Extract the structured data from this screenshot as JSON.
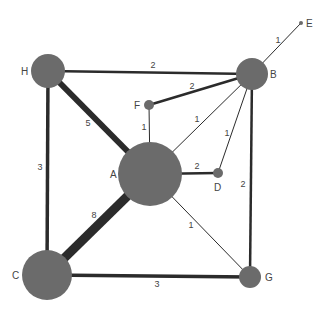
{
  "graph": {
    "colors": {
      "node": "#6b6b6b",
      "edge": "#2b2b2b",
      "text": "#444444",
      "background": "#ffffff"
    },
    "nodes": [
      {
        "id": "A",
        "label": "A",
        "x": 150,
        "y": 174,
        "r": 32,
        "label_x": 110,
        "label_y": 178
      },
      {
        "id": "B",
        "label": "B",
        "x": 252,
        "y": 74,
        "r": 16,
        "label_x": 270,
        "label_y": 78
      },
      {
        "id": "C",
        "label": "C",
        "x": 47,
        "y": 275,
        "r": 25,
        "label_x": 12,
        "label_y": 279
      },
      {
        "id": "D",
        "label": "D",
        "x": 218,
        "y": 173,
        "r": 5,
        "label_x": 214,
        "label_y": 191
      },
      {
        "id": "E",
        "label": "E",
        "x": 301,
        "y": 23,
        "r": 2,
        "label_x": 306,
        "label_y": 27
      },
      {
        "id": "F",
        "label": "F",
        "x": 149,
        "y": 105,
        "r": 5,
        "label_x": 134,
        "label_y": 109
      },
      {
        "id": "G",
        "label": "G",
        "x": 250,
        "y": 277,
        "r": 11,
        "label_x": 265,
        "label_y": 281
      },
      {
        "id": "H",
        "label": "H",
        "x": 48,
        "y": 71,
        "r": 17,
        "label_x": 21,
        "label_y": 75
      }
    ],
    "edges": [
      {
        "from": "H",
        "to": "B",
        "weight": "2",
        "width": 2.5,
        "label_x": 153,
        "label_y": 66
      },
      {
        "from": "H",
        "to": "A",
        "weight": "5",
        "width": 6,
        "label_x": 88,
        "label_y": 124
      },
      {
        "from": "H",
        "to": "C",
        "weight": "3",
        "width": 3.5,
        "label_x": 40,
        "label_y": 168
      },
      {
        "from": "C",
        "to": "A",
        "weight": "8",
        "width": 9,
        "label_x": 94,
        "label_y": 216
      },
      {
        "from": "C",
        "to": "G",
        "weight": "3",
        "width": 3.5,
        "label_x": 157,
        "label_y": 285
      },
      {
        "from": "B",
        "to": "E",
        "weight": "1",
        "width": 1,
        "label_x": 278,
        "label_y": 41
      },
      {
        "from": "B",
        "to": "F",
        "weight": "2",
        "width": 2.5,
        "label_x": 192,
        "label_y": 87
      },
      {
        "from": "B",
        "to": "A",
        "weight": "1",
        "width": 1,
        "label_x": 197,
        "label_y": 120
      },
      {
        "from": "B",
        "to": "D",
        "weight": "1",
        "width": 1,
        "label_x": 227,
        "label_y": 134
      },
      {
        "from": "B",
        "to": "G",
        "weight": "2",
        "width": 2.5,
        "label_x": 243,
        "label_y": 185
      },
      {
        "from": "F",
        "to": "A",
        "weight": "1",
        "width": 1,
        "label_x": 144,
        "label_y": 128
      },
      {
        "from": "A",
        "to": "D",
        "weight": "2",
        "width": 2.5,
        "label_x": 197,
        "label_y": 167
      },
      {
        "from": "A",
        "to": "G",
        "weight": "1",
        "width": 1,
        "label_x": 191,
        "label_y": 226
      }
    ]
  }
}
